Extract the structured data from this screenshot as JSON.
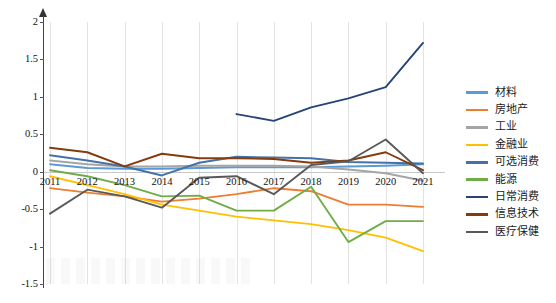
{
  "chart_data": {
    "type": "line",
    "title": "",
    "xlabel": "",
    "ylabel": "",
    "x": [
      2011,
      2012,
      2013,
      2014,
      2015,
      2016,
      2017,
      2018,
      2019,
      2020,
      2021
    ],
    "xticklabels": [
      "2011",
      "2012",
      "2013",
      "2014",
      "2015",
      "2016",
      "2017",
      "2018",
      "2019",
      "2020",
      "2021"
    ],
    "yticklabels": [
      "2",
      "1.5",
      "1",
      "0.5",
      "0",
      "-0.5",
      "-1",
      "-1.5"
    ],
    "ylim": [
      -1.5,
      2
    ],
    "ytickvalues": [
      2,
      1.5,
      1,
      0.5,
      0,
      -0.5,
      -1,
      -1.5
    ],
    "grid": "vertical",
    "legend_position": "right",
    "series": [
      {
        "name": "材料",
        "color": "#5b9bd5",
        "values": [
          0.1,
          0.05,
          0.04,
          0.04,
          0.05,
          0.06,
          0.06,
          0.06,
          0.07,
          0.08,
          0.1
        ]
      },
      {
        "name": "房地产",
        "color": "#ed7d31",
        "values": [
          -0.22,
          -0.28,
          -0.33,
          -0.4,
          -0.36,
          -0.3,
          -0.22,
          -0.26,
          -0.44,
          -0.44,
          -0.47
        ]
      },
      {
        "name": "工业",
        "color": "#a5a5a5",
        "values": [
          0.15,
          0.1,
          0.07,
          0.07,
          0.08,
          0.08,
          0.08,
          0.07,
          0.03,
          -0.02,
          -0.12
        ]
      },
      {
        "name": "金融业",
        "color": "#ffc000",
        "values": [
          -0.06,
          -0.18,
          -0.3,
          -0.44,
          -0.52,
          -0.6,
          -0.65,
          -0.7,
          -0.78,
          -0.88,
          -1.06
        ]
      },
      {
        "name": "可选消费",
        "color": "#4472a8",
        "values": [
          0.22,
          0.15,
          0.07,
          -0.05,
          0.12,
          0.2,
          0.19,
          0.18,
          0.13,
          0.12,
          0.11
        ]
      },
      {
        "name": "能源",
        "color": "#70ad47",
        "values": [
          0.02,
          -0.06,
          -0.18,
          -0.33,
          -0.32,
          -0.52,
          -0.52,
          -0.2,
          -0.94,
          -0.66,
          -0.66
        ]
      },
      {
        "name": "日常消费",
        "color": "#264478",
        "values": [
          null,
          null,
          null,
          null,
          null,
          0.77,
          0.68,
          0.86,
          0.98,
          1.13,
          1.72
        ]
      },
      {
        "name": "信息技术",
        "color": "#843c0c",
        "values": [
          0.32,
          0.26,
          0.07,
          0.24,
          0.18,
          0.18,
          0.17,
          0.12,
          0.15,
          0.26,
          0.02
        ]
      },
      {
        "name": "医疗保健",
        "color": "#595959",
        "values": [
          -0.56,
          -0.24,
          -0.33,
          -0.48,
          -0.08,
          -0.06,
          -0.3,
          0.09,
          0.14,
          0.43,
          -0.02
        ]
      }
    ]
  }
}
